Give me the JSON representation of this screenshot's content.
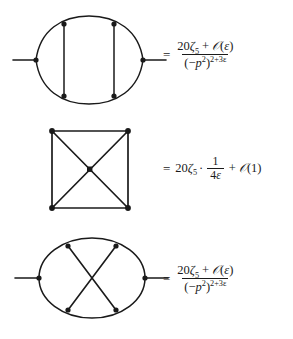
{
  "figure": {
    "background_color": "#ffffff",
    "ink_color": "#1a1a1a",
    "equation_count": 3
  },
  "equations": [
    {
      "id": "equation-1",
      "diagram": {
        "name": "two-rung-lens-propagator-diagram",
        "description": "lens shaped two-loop bubble with two vertical rungs and external legs",
        "vertex_count": 6,
        "external_legs": 2
      },
      "relation": {
        "equals": "=",
        "kind": "fraction",
        "numerator": {
          "coefficient": "20",
          "zeta": "ζ",
          "zeta_index": "5",
          "plus": "+",
          "order_symbol": "𝒪",
          "order_argument": "ε"
        },
        "denominator": {
          "base_open": "(",
          "minus": "−",
          "momentum": "p",
          "momentum_power": "2",
          "base_close": ")",
          "exponent": "2+3ε"
        }
      }
    },
    {
      "id": "equation-2",
      "diagram": {
        "name": "square-with-diagonals-diagram",
        "description": "square box with both diagonals crossing at a central vertex",
        "vertex_count": 5,
        "external_legs": 0
      },
      "relation": {
        "equals": "=",
        "kind": "product",
        "coefficient": "20",
        "zeta": "ζ",
        "zeta_index": "5",
        "cdot": "·",
        "pole_numerator": "1",
        "pole_denominator_coefficient": "4",
        "pole_denominator_symbol": "ε",
        "plus": "+",
        "order_symbol": "𝒪",
        "order_argument": "(1)"
      }
    },
    {
      "id": "equation-3",
      "diagram": {
        "name": "crossed-ellipse-propagator-diagram",
        "description": "ellipse with two crossing internal lines between four rim vertices and external legs",
        "vertex_count": 6,
        "external_legs": 2
      },
      "relation": {
        "equals": "=",
        "kind": "fraction",
        "numerator": {
          "coefficient": "20",
          "zeta": "ζ",
          "zeta_index": "5",
          "plus": "+",
          "order_symbol": "𝒪",
          "order_argument": "ε"
        },
        "denominator": {
          "base_open": "(",
          "minus": "−",
          "momentum": "p",
          "momentum_power": "2",
          "base_close": ")",
          "exponent": "2+3ε"
        }
      }
    }
  ]
}
